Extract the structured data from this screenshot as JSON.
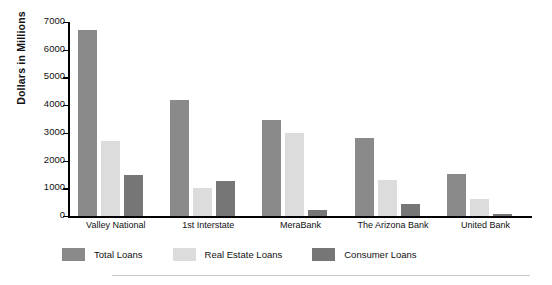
{
  "chart_data": {
    "type": "bar",
    "title": "",
    "xlabel": "",
    "ylabel": "Dollars in Millions",
    "ylim": [
      0,
      7000
    ],
    "yticks": [
      0,
      1000,
      2000,
      3000,
      4000,
      5000,
      6000,
      7000
    ],
    "ytick_labels": [
      "0",
      "1000",
      "2000",
      "3000",
      "4000",
      "5000",
      "6000",
      "7000"
    ],
    "grid": false,
    "legend_position": "bottom-left",
    "categories": [
      "Valley National",
      "1st Interstate",
      "MeraBank",
      "The Arizona Bank",
      "United Bank"
    ],
    "series": [
      {
        "name": "Total Loans",
        "color": "#8a8a8a",
        "values": [
          6700,
          4200,
          3450,
          2800,
          1500
        ]
      },
      {
        "name": "Real Estate Loans",
        "color": "#dcdcdc",
        "values": [
          2700,
          1000,
          3000,
          1300,
          620
        ]
      },
      {
        "name": "Consumer Loans",
        "color": "#767676",
        "values": [
          1480,
          1250,
          230,
          420,
          90
        ]
      }
    ]
  },
  "axis": {
    "y_title": "Dollars in Millions"
  },
  "legend": {
    "items": [
      {
        "label": "Total Loans",
        "color": "#8a8a8a"
      },
      {
        "label": "Real Estate Loans",
        "color": "#dcdcdc"
      },
      {
        "label": "Consumer Loans",
        "color": "#767676"
      }
    ]
  }
}
